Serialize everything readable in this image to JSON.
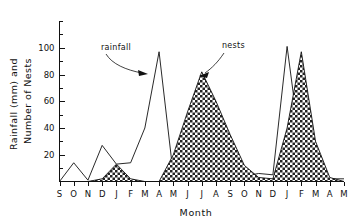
{
  "chart_data": {
    "type": "line",
    "title": "",
    "xlabel": "Month",
    "ylabel": "Rainfall (mm) and Number of Nests",
    "ylabel_line1": "Rainfall (mm) and",
    "ylabel_line2": "Number of Nests",
    "categories": [
      "S",
      "O",
      "N",
      "D",
      "J",
      "F",
      "M",
      "A",
      "M",
      "J",
      "J",
      "A",
      "S",
      "O",
      "N",
      "D",
      "J",
      "F",
      "M",
      "A",
      "M"
    ],
    "ylim": [
      0,
      120
    ],
    "ytick_labels": [
      "20",
      "40",
      "60",
      "80",
      "100"
    ],
    "ytick_values": [
      20,
      40,
      60,
      80,
      100
    ],
    "yminor_step": 10,
    "grid": false,
    "legend_position": "none",
    "series": [
      {
        "name": "rainfall",
        "style": "line",
        "values": [
          0,
          14,
          1,
          27,
          13,
          14,
          40,
          97,
          5,
          2,
          2,
          2,
          2,
          4,
          6,
          5,
          101,
          20,
          3,
          2,
          2
        ]
      },
      {
        "name": "nests",
        "style": "filled-checkered",
        "values": [
          0,
          0,
          0,
          2,
          13,
          2,
          0,
          0,
          20,
          52,
          82,
          60,
          35,
          12,
          3,
          2,
          40,
          97,
          30,
          3,
          0
        ]
      }
    ],
    "annotations": [
      {
        "text": "rainfall",
        "points_to": "rainfall peak at A (April)"
      },
      {
        "text": "nests",
        "points_to": "nests peak at J (July)"
      }
    ]
  },
  "axis": {
    "x_title": "Month",
    "y_title_line1": "Rainfall (mm) and",
    "y_title_line2": "Number of Nests"
  },
  "annotations": {
    "rainfall_label": "rainfall",
    "nests_label": "nests"
  },
  "colors": {
    "ink": "#111111",
    "background": "#ffffff"
  }
}
